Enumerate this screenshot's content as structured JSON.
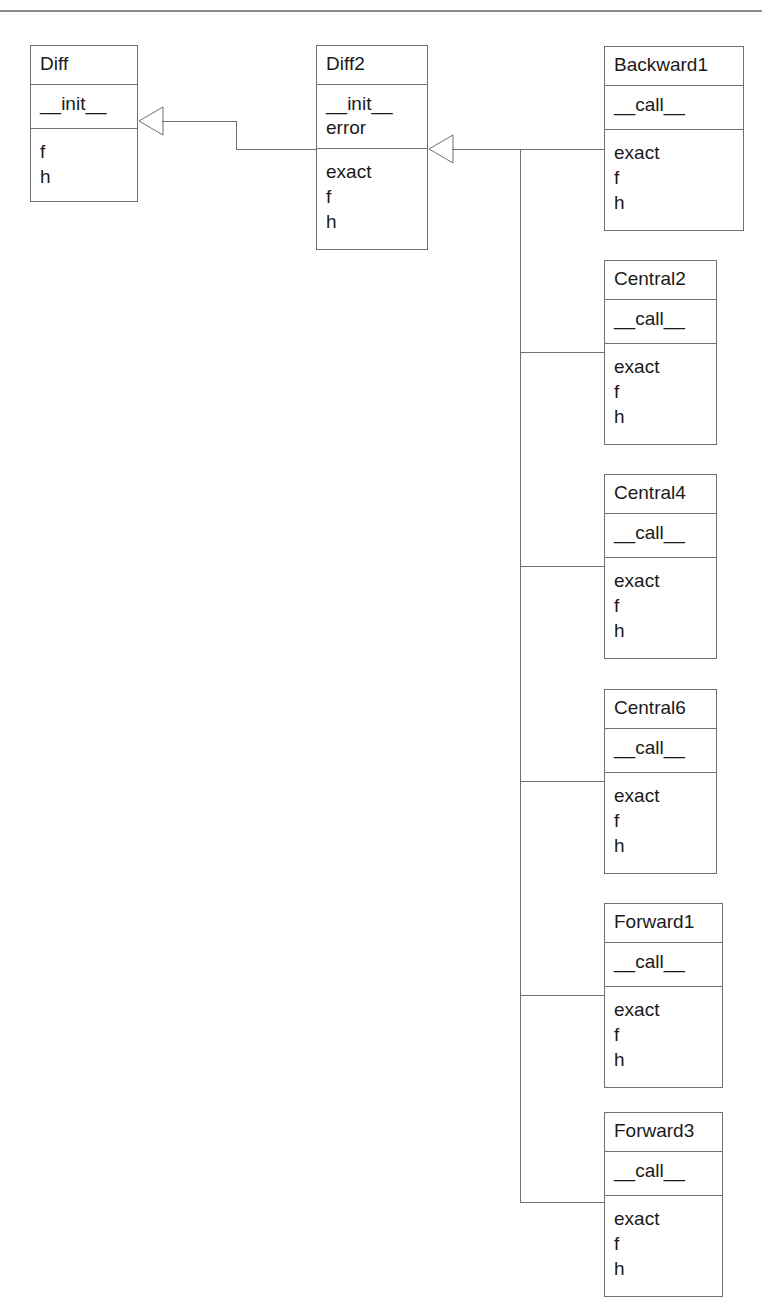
{
  "diagram": {
    "kind": "uml-class-diagram",
    "title_rule_visible": true,
    "background": "#ffffff",
    "line_color": "#6f6f6f",
    "rule_color": "#8d8d8d",
    "classes": [
      {
        "id": "diff",
        "name": "Diff",
        "operations": [
          "__init__"
        ],
        "attributes": [
          "f",
          "h"
        ],
        "x": 30,
        "y": 45,
        "w": 108,
        "h_name": 39,
        "h_ops": 44,
        "h_attrs": 72
      },
      {
        "id": "diff2",
        "name": "Diff2",
        "operations": [
          "__init__",
          "error"
        ],
        "attributes": [
          "exact",
          "f",
          "h"
        ],
        "x": 316,
        "y": 45,
        "w": 112,
        "h_name": 39,
        "h_ops": 64,
        "h_attrs": 100
      },
      {
        "id": "backward1",
        "name": "Backward1",
        "operations": [
          "__call__"
        ],
        "attributes": [
          "exact",
          "f",
          "h"
        ],
        "x": 604,
        "y": 46,
        "w": 140,
        "h_name": 39,
        "h_ops": 44,
        "h_attrs": 100
      },
      {
        "id": "central2",
        "name": "Central2",
        "operations": [
          "__call__"
        ],
        "attributes": [
          "exact",
          "f",
          "h"
        ],
        "x": 604,
        "y": 260,
        "w": 113,
        "h_name": 39,
        "h_ops": 44,
        "h_attrs": 100
      },
      {
        "id": "central4",
        "name": "Central4",
        "operations": [
          "__call__"
        ],
        "attributes": [
          "exact",
          "f",
          "h"
        ],
        "x": 604,
        "y": 474,
        "w": 113,
        "h_name": 39,
        "h_ops": 44,
        "h_attrs": 100
      },
      {
        "id": "central6",
        "name": "Central6",
        "operations": [
          "__call__"
        ],
        "attributes": [
          "exact",
          "f",
          "h"
        ],
        "x": 604,
        "y": 689,
        "w": 113,
        "h_name": 39,
        "h_ops": 44,
        "h_attrs": 100
      },
      {
        "id": "forward1",
        "name": "Forward1",
        "operations": [
          "__call__"
        ],
        "attributes": [
          "exact",
          "f",
          "h"
        ],
        "x": 604,
        "y": 903,
        "w": 119,
        "h_name": 39,
        "h_ops": 44,
        "h_attrs": 100
      },
      {
        "id": "forward3",
        "name": "Forward3",
        "operations": [
          "__call__"
        ],
        "attributes": [
          "exact",
          "f",
          "h"
        ],
        "x": 604,
        "y": 1112,
        "w": 119,
        "h_name": 39,
        "h_ops": 44,
        "h_attrs": 100
      }
    ],
    "generalizations": [
      {
        "id": "diff2-to-diff",
        "from": "Diff2",
        "to": "Diff",
        "arrow_at": "Diff right edge"
      },
      {
        "id": "subclasses-to-diff2",
        "from": [
          "Backward1",
          "Central2",
          "Central4",
          "Central6",
          "Forward1",
          "Forward3"
        ],
        "to": "Diff2",
        "arrow_at": "Diff2 right edge"
      }
    ]
  }
}
